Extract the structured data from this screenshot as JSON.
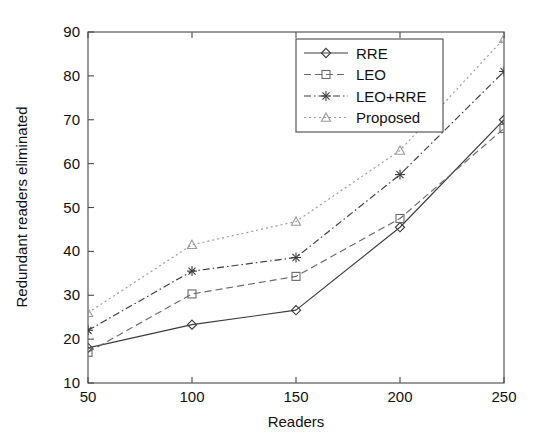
{
  "chart_data": {
    "type": "line",
    "title": "",
    "xlabel": "Readers",
    "ylabel": "Redundant readers eliminated",
    "x": [
      50,
      100,
      150,
      200,
      250
    ],
    "xlim": [
      50,
      250
    ],
    "ylim": [
      10,
      90
    ],
    "xticks": [
      "50",
      "100",
      "150",
      "200",
      "250"
    ],
    "yticks": [
      "10",
      "20",
      "30",
      "40",
      "50",
      "60",
      "70",
      "80",
      "90"
    ],
    "grid": false,
    "legend_position": "top-center-right",
    "series": [
      {
        "name": "RRE",
        "marker": "diamond",
        "linestyle": "solid",
        "color": "#3c3c3c",
        "values": [
          18,
          23.3,
          26.6,
          45.5,
          70
        ]
      },
      {
        "name": "LEO",
        "marker": "square",
        "linestyle": "dashed",
        "color": "#6b6b6b",
        "values": [
          17,
          30.3,
          34.3,
          47.5,
          68
        ]
      },
      {
        "name": "LEO+RRE",
        "marker": "asterisk",
        "linestyle": "dashdot",
        "color": "#3c3c3c",
        "values": [
          22,
          35.5,
          38.6,
          57.5,
          81
        ]
      },
      {
        "name": "Proposed",
        "marker": "triangle",
        "linestyle": "dotted",
        "color": "#9a9a9a",
        "values": [
          26,
          41.5,
          46.8,
          63,
          88.5
        ]
      }
    ]
  },
  "legend": {
    "entries": [
      "RRE",
      "LEO",
      "LEO+RRE",
      "Proposed"
    ]
  },
  "axes": {
    "x_title": "Readers",
    "y_title": "Redundant readers eliminated",
    "x_tick_labels": [
      "50",
      "100",
      "150",
      "200",
      "250"
    ],
    "y_tick_labels": [
      "10",
      "20",
      "30",
      "40",
      "50",
      "60",
      "70",
      "80",
      "90"
    ]
  }
}
